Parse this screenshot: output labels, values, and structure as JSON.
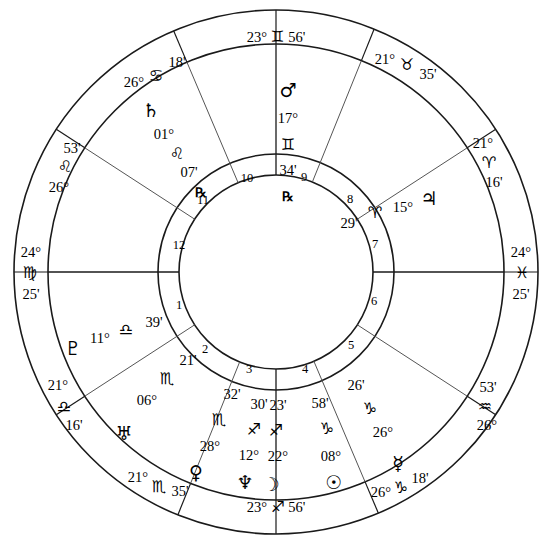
{
  "chart": {
    "type": "astrological-wheel",
    "rings": {
      "outer_radius": 262,
      "cusp_ring_inner_radius": 228,
      "planet_ring_inner_radius": 118,
      "house_number_ring_inner_radius": 97,
      "center_x": 276,
      "center_y": 272
    },
    "colors": {
      "stroke": "#1a1a1a",
      "background": "#ffffff",
      "text": "#000000"
    }
  },
  "house_cusps": [
    {
      "house": 1,
      "label": "ASC",
      "degree": "24°",
      "sign": "♍",
      "sign_name": "Virgo",
      "minute": "25'",
      "angle": 180,
      "stack": "left"
    },
    {
      "house": 2,
      "label": "",
      "degree": "21°",
      "sign": "♎",
      "sign_name": "Libra",
      "minute": "16'",
      "angle": 213,
      "stack": "arc"
    },
    {
      "house": 3,
      "label": "",
      "degree": "21°",
      "sign": "♏",
      "sign_name": "Scorpio",
      "minute": "35'",
      "angle": 248,
      "stack": "arc"
    },
    {
      "house": 4,
      "label": "IC",
      "degree": "23°",
      "sign": "♐",
      "sign_name": "Sagittarius",
      "minute": "56'",
      "angle": 270,
      "stack": "flat"
    },
    {
      "house": 5,
      "label": "",
      "degree": "26°",
      "sign": "♑",
      "sign_name": "Capricorn",
      "minute": "18'",
      "angle": 293,
      "stack": "arc"
    },
    {
      "house": 6,
      "label": "",
      "degree": "26°",
      "sign": "♒",
      "sign_name": "Aquarius",
      "minute": "53'",
      "angle": 327,
      "stack": "arc"
    },
    {
      "house": 7,
      "label": "DSC",
      "degree": "24°",
      "sign": "♓",
      "sign_name": "Pisces",
      "minute": "25'",
      "angle": 0,
      "stack": "right"
    },
    {
      "house": 8,
      "label": "",
      "degree": "21°",
      "sign": "♈",
      "sign_name": "Aries",
      "minute": "16'",
      "angle": 33,
      "stack": "arc"
    },
    {
      "house": 9,
      "label": "",
      "degree": "21°",
      "sign": "♉",
      "sign_name": "Taurus",
      "minute": "35'",
      "angle": 68,
      "stack": "arc"
    },
    {
      "house": 10,
      "label": "MC",
      "degree": "23°",
      "sign": "♊",
      "sign_name": "Gemini",
      "minute": "56'",
      "angle": 90,
      "stack": "flat"
    },
    {
      "house": 11,
      "label": "",
      "degree": "26°",
      "sign": "♋",
      "sign_name": "Cancer",
      "minute": "18'",
      "angle": 113,
      "stack": "arc"
    },
    {
      "house": 12,
      "label": "",
      "degree": "26°",
      "sign": "♌",
      "sign_name": "Leo",
      "minute": "53'",
      "angle": 147,
      "stack": "arc"
    }
  ],
  "house_numbers": [
    "1",
    "2",
    "3",
    "4",
    "5",
    "6",
    "7",
    "8",
    "9",
    "10",
    "11",
    "12"
  ],
  "planets": [
    {
      "name": "Mars",
      "glyph": "♂",
      "degree": "17°",
      "sign": "♊",
      "sign_name": "Gemini",
      "minute": "34'",
      "retrograde": "℞",
      "house": 9
    },
    {
      "name": "Saturn",
      "glyph": "♄",
      "degree": "01°",
      "sign": "♌",
      "sign_name": "Leo",
      "minute": "07'",
      "retrograde": "℞",
      "house": 11
    },
    {
      "name": "Jupiter",
      "glyph": "♃",
      "degree": "15°",
      "sign": "♈",
      "sign_name": "Aries",
      "minute": "29'",
      "retrograde": "",
      "house": 8
    },
    {
      "name": "Pluto",
      "glyph": "♇",
      "degree": "11°",
      "sign": "♎",
      "sign_name": "Libra",
      "minute": "39'",
      "retrograde": "",
      "house": 1
    },
    {
      "name": "Uranus",
      "glyph": "♅",
      "degree": "06°",
      "sign": "♏",
      "sign_name": "Scorpio",
      "minute": "21'",
      "retrograde": "",
      "house": 2
    },
    {
      "name": "Venus",
      "glyph": "♀",
      "degree": "28°",
      "sign": "♏",
      "sign_name": "Scorpio",
      "minute": "32'",
      "retrograde": "",
      "house": 2
    },
    {
      "name": "Neptune",
      "glyph": "♆",
      "degree": "12°",
      "sign": "♐",
      "sign_name": "Sagittarius",
      "minute": "30'",
      "retrograde": "",
      "house": 3
    },
    {
      "name": "Moon",
      "glyph": "☽",
      "degree": "22°",
      "sign": "♐",
      "sign_name": "Sagittarius",
      "minute": "23'",
      "retrograde": "",
      "house": 3
    },
    {
      "name": "Sun",
      "glyph": "☉",
      "degree": "08°",
      "sign": "♑",
      "sign_name": "Capricorn",
      "minute": "58'",
      "retrograde": "",
      "house": 4
    },
    {
      "name": "Mercury",
      "glyph": "☿",
      "degree": "26°",
      "sign": "♑",
      "sign_name": "Capricorn",
      "minute": "26'",
      "retrograde": "",
      "house": 4
    }
  ],
  "labels": {
    "mars_deg": "17°",
    "mars_sign": "♊",
    "mars_min": "34'",
    "mars_glyph": "♂",
    "mars_retro": "℞",
    "saturn_glyph": "♄",
    "saturn_deg": "01°",
    "saturn_sign": "♌",
    "saturn_min": "07'",
    "saturn_retro": "℞",
    "jupiter_glyph": "♃",
    "jupiter_deg": "15°",
    "jupiter_sign": "♈",
    "jupiter_min": "29'",
    "pluto_glyph": "♇",
    "pluto_deg": "11°",
    "pluto_sign": "♎",
    "pluto_min": "39'",
    "uranus_glyph": "♅",
    "uranus_deg": "06°",
    "uranus_sign": "♏",
    "uranus_min": "21'",
    "venus_glyph": "♀",
    "venus_deg": "28°",
    "venus_sign": "♏",
    "venus_min": "32'",
    "neptune_glyph": "♆",
    "neptune_deg": "12°",
    "neptune_sign": "♐",
    "neptune_min": "30'",
    "moon_glyph": "☽",
    "moon_deg": "22°",
    "moon_sign": "♐",
    "moon_min": "23'",
    "sun_glyph": "☉",
    "sun_deg": "08°",
    "sun_sign": "♑",
    "sun_min": "58'",
    "mercury_glyph": "☿",
    "mercury_deg": "26°",
    "mercury_sign": "♑",
    "mercury_min": "26'",
    "mc_deg": "23°",
    "mc_sign": "♊",
    "mc_min": "56'",
    "ic_deg": "23°",
    "ic_sign": "♐",
    "ic_min": "56'",
    "asc_deg": "24°",
    "asc_sign": "♍",
    "asc_min": "25'",
    "dsc_deg": "24°",
    "dsc_sign": "♓",
    "dsc_min": "25'",
    "c11_deg": "26°",
    "c11_sign": "♋",
    "c11_min": "18'",
    "c12_deg": "26°",
    "c12_sign": "♌",
    "c12_min": "53'",
    "c2_deg": "21°",
    "c2_sign": "♎",
    "c2_min": "16'",
    "c3_deg": "21°",
    "c3_sign": "♏",
    "c3_min": "35'",
    "c5_deg": "26°",
    "c5_sign": "♑",
    "c5_min": "18'",
    "c6_deg": "26°",
    "c6_sign": "♒",
    "c6_min": "53'",
    "c8_deg": "21°",
    "c8_sign": "♈",
    "c8_min": "16'",
    "c9_deg": "21°",
    "c9_sign": "♉",
    "c9_min": "35'",
    "h1": "1",
    "h2": "2",
    "h3": "3",
    "h4": "4",
    "h5": "5",
    "h6": "6",
    "h7": "7",
    "h8": "8",
    "h9": "9",
    "h10": "10",
    "h11": "11",
    "h12": "12"
  }
}
